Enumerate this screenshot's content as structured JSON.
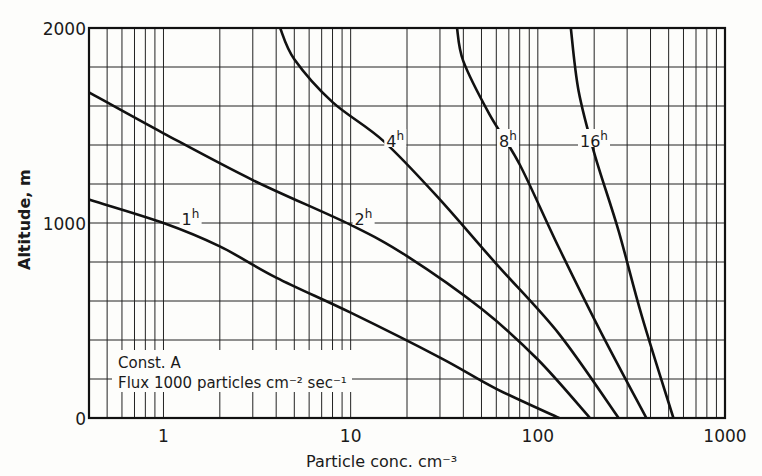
{
  "chart_data": {
    "type": "line",
    "title": "",
    "xlabel": "Particle conc. cm⁻³",
    "ylabel": "Altitude, m",
    "xscale": "log",
    "xlim": [
      0.4,
      1000
    ],
    "ylim": [
      0,
      2000
    ],
    "grid": true,
    "x_tick_labels": [
      "1",
      "10",
      "100",
      "1000"
    ],
    "x_ticks": [
      1,
      10,
      100,
      1000
    ],
    "y_tick_labels": [
      "0",
      "1000",
      "2000"
    ],
    "y_ticks": [
      0,
      1000,
      2000
    ],
    "y_grid_step": 200,
    "annotation": {
      "line1": "Const. A",
      "line2": "Flux 1000 particles cm⁻² sec⁻¹"
    },
    "series": [
      {
        "name": "1h",
        "label_base": "1",
        "label_sup": "h",
        "points": [
          [
            0.4,
            1120
          ],
          [
            1,
            1000
          ],
          [
            2,
            880
          ],
          [
            4,
            720
          ],
          [
            10,
            540
          ],
          [
            30,
            310
          ],
          [
            60,
            150
          ],
          [
            130,
            0
          ]
        ],
        "label_at": [
          1.25,
          1000
        ]
      },
      {
        "name": "2h",
        "label_base": "2",
        "label_sup": "h",
        "points": [
          [
            0.4,
            1670
          ],
          [
            1,
            1460
          ],
          [
            3,
            1220
          ],
          [
            10,
            990
          ],
          [
            20,
            830
          ],
          [
            50,
            560
          ],
          [
            100,
            300
          ],
          [
            190,
            0
          ]
        ],
        "label_at": [
          10.5,
          1000
        ]
      },
      {
        "name": "4h",
        "label_base": "4",
        "label_sup": "h",
        "points": [
          [
            4.2,
            2000
          ],
          [
            5,
            1840
          ],
          [
            8,
            1620
          ],
          [
            15,
            1420
          ],
          [
            30,
            1120
          ],
          [
            60,
            790
          ],
          [
            130,
            430
          ],
          [
            270,
            0
          ]
        ],
        "label_at": [
          15.5,
          1400
        ]
      },
      {
        "name": "8h",
        "label_base": "8",
        "label_sup": "h",
        "points": [
          [
            37,
            2000
          ],
          [
            40,
            1830
          ],
          [
            55,
            1560
          ],
          [
            80,
            1300
          ],
          [
            130,
            870
          ],
          [
            220,
            430
          ],
          [
            380,
            0
          ]
        ],
        "label_at": [
          62,
          1400
        ]
      },
      {
        "name": "16h",
        "label_base": "16",
        "label_sup": "h",
        "points": [
          [
            150,
            2000
          ],
          [
            165,
            1680
          ],
          [
            200,
            1360
          ],
          [
            270,
            960
          ],
          [
            360,
            520
          ],
          [
            530,
            0
          ]
        ],
        "label_at": [
          168,
          1400
        ]
      }
    ]
  }
}
